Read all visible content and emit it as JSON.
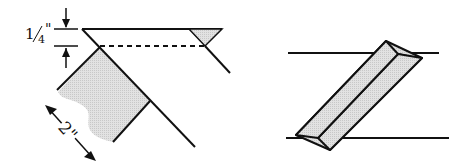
{
  "figure_left": {
    "seam_allowance_label": "1/4\"",
    "seam_allowance_whole": "1",
    "seam_allowance_num": "4",
    "length_label": "2\"",
    "fill_color": "#d9d9d9",
    "line_color": "#111111"
  },
  "figure_right": {
    "fill_color": "#d9d9d9",
    "line_color": "#111111"
  }
}
